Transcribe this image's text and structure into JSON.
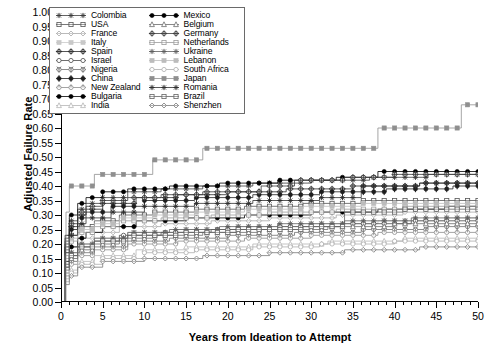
{
  "chart_data": {
    "type": "line",
    "title": "",
    "xlabel": "Years from Ideation to Attempt",
    "ylabel": "Adjusted Failure Rate",
    "xlim": [
      0,
      50
    ],
    "ylim": [
      0.0,
      1.0
    ],
    "xticks": [
      0,
      5,
      10,
      15,
      20,
      25,
      30,
      35,
      40,
      45,
      50
    ],
    "xtick_labels": [
      "0",
      "5",
      "10",
      "15",
      "20",
      "25",
      "30",
      "35",
      "40",
      "45",
      "50"
    ],
    "yticks": [
      0.0,
      0.05,
      0.1,
      0.15,
      0.2,
      0.25,
      0.3,
      0.35,
      0.4,
      0.45,
      0.5,
      0.55,
      0.6,
      0.65,
      0.7,
      0.75,
      0.8,
      0.85,
      0.9,
      0.95,
      1.0
    ],
    "ytick_labels": [
      "0.00",
      "0.05",
      "0.10",
      "0.15",
      "0.20",
      "0.25",
      "0.30",
      "0.35",
      "0.40",
      "0.45",
      "0.50",
      "0.55",
      "0.60",
      "0.65",
      "0.70",
      "0.75",
      "0.80",
      "0.85",
      "0.90",
      "0.95",
      "1.00"
    ],
    "grid": false,
    "legend_position": "upper-left",
    "step_style": "post",
    "series": [
      {
        "name": "Colombia",
        "marker": "star",
        "color": "#3d3d3d",
        "x": [
          0,
          0.5,
          1,
          2,
          3,
          5,
          8,
          12,
          17,
          23,
          30,
          37,
          44,
          50
        ],
        "y": [
          0.0,
          0.22,
          0.28,
          0.32,
          0.34,
          0.36,
          0.38,
          0.39,
          0.4,
          0.41,
          0.42,
          0.43,
          0.44,
          0.44
        ]
      },
      {
        "name": "USA",
        "marker": "square-open",
        "color": "#555555",
        "x": [
          0,
          0.5,
          1,
          2,
          4,
          7,
          11,
          16,
          22,
          29,
          36,
          43,
          50
        ],
        "y": [
          0.0,
          0.18,
          0.23,
          0.26,
          0.28,
          0.3,
          0.31,
          0.32,
          0.33,
          0.34,
          0.35,
          0.35,
          0.35
        ]
      },
      {
        "name": "France",
        "marker": "diamond-open",
        "color": "#a8a8a8",
        "x": [
          0,
          0.5,
          1,
          2,
          4,
          7,
          12,
          18,
          25,
          33,
          41,
          50
        ],
        "y": [
          0.0,
          0.15,
          0.19,
          0.22,
          0.24,
          0.26,
          0.27,
          0.28,
          0.29,
          0.3,
          0.31,
          0.31
        ]
      },
      {
        "name": "Italy",
        "marker": "square-filled",
        "color": "#c9c9c9",
        "x": [
          0,
          0.5,
          1,
          2,
          4,
          8,
          14,
          21,
          29,
          38,
          46,
          50
        ],
        "y": [
          0.0,
          0.13,
          0.17,
          0.2,
          0.22,
          0.24,
          0.25,
          0.26,
          0.27,
          0.28,
          0.29,
          0.29
        ]
      },
      {
        "name": "Spain",
        "marker": "circle-cross",
        "color": "#2b2b2b",
        "x": [
          0,
          0.5,
          1,
          2,
          3,
          5,
          9,
          14,
          20,
          27,
          35,
          43,
          50
        ],
        "y": [
          0.0,
          0.2,
          0.26,
          0.3,
          0.32,
          0.34,
          0.36,
          0.37,
          0.38,
          0.39,
          0.4,
          0.41,
          0.41
        ]
      },
      {
        "name": "Israel",
        "marker": "circle-open",
        "color": "#4a4a4a",
        "x": [
          0,
          0.5,
          1,
          2,
          4,
          7,
          12,
          18,
          26,
          34,
          42,
          50
        ],
        "y": [
          0.0,
          0.12,
          0.16,
          0.19,
          0.21,
          0.23,
          0.24,
          0.25,
          0.26,
          0.27,
          0.28,
          0.28
        ]
      },
      {
        "name": "Nigeria",
        "marker": "circle-y",
        "color": "#707070",
        "x": [
          0,
          0.5,
          1,
          2,
          4,
          8,
          13,
          20,
          28,
          36,
          44,
          50
        ],
        "y": [
          0.0,
          0.1,
          0.14,
          0.17,
          0.19,
          0.21,
          0.22,
          0.23,
          0.24,
          0.25,
          0.26,
          0.26
        ]
      },
      {
        "name": "China",
        "marker": "circle-plus",
        "color": "#1f1f1f",
        "x": [
          0,
          0.5,
          1,
          2,
          3,
          6,
          10,
          16,
          23,
          31,
          39,
          47,
          50
        ],
        "y": [
          0.0,
          0.19,
          0.25,
          0.29,
          0.31,
          0.33,
          0.35,
          0.36,
          0.37,
          0.38,
          0.39,
          0.4,
          0.4
        ]
      },
      {
        "name": "New Zealand",
        "marker": "circle-dash",
        "color": "#8d8d8d",
        "x": [
          0,
          0.5,
          1,
          2,
          4,
          8,
          14,
          22,
          30,
          38,
          46,
          50
        ],
        "y": [
          0.0,
          0.09,
          0.13,
          0.16,
          0.18,
          0.2,
          0.21,
          0.22,
          0.23,
          0.24,
          0.24,
          0.24
        ]
      },
      {
        "name": "Bulgaria",
        "marker": "circle-filled",
        "color": "#000000",
        "x": [
          0,
          0.5,
          1,
          2,
          3,
          5,
          9,
          15,
          22,
          30,
          38,
          46,
          50
        ],
        "y": [
          0.0,
          0.14,
          0.19,
          0.22,
          0.24,
          0.26,
          0.28,
          0.29,
          0.3,
          0.31,
          0.32,
          0.33,
          0.33
        ]
      },
      {
        "name": "India",
        "marker": "triangle-open",
        "color": "#b5b5b5",
        "x": [
          0,
          0.5,
          1,
          2,
          4,
          9,
          15,
          23,
          32,
          41,
          50
        ],
        "y": [
          0.0,
          0.08,
          0.11,
          0.14,
          0.16,
          0.18,
          0.19,
          0.2,
          0.21,
          0.22,
          0.22
        ]
      },
      {
        "name": "Mexico",
        "marker": "circle-filled",
        "color": "#000000",
        "x": [
          0,
          0.5,
          1,
          2,
          3,
          5,
          8,
          13,
          19,
          26,
          33,
          38,
          44,
          50
        ],
        "y": [
          0.0,
          0.23,
          0.3,
          0.34,
          0.36,
          0.38,
          0.39,
          0.4,
          0.41,
          0.42,
          0.43,
          0.45,
          0.45,
          0.45
        ]
      },
      {
        "name": "Belgium",
        "marker": "triangle-open",
        "color": "#6b6b6b",
        "x": [
          0,
          0.5,
          1,
          2,
          4,
          7,
          11,
          17,
          24,
          32,
          40,
          48,
          50
        ],
        "y": [
          0.0,
          0.11,
          0.15,
          0.18,
          0.2,
          0.22,
          0.23,
          0.24,
          0.25,
          0.26,
          0.27,
          0.27,
          0.27
        ]
      },
      {
        "name": "Germany",
        "marker": "circle-cross",
        "color": "#3a3a3a",
        "x": [
          0,
          0.5,
          1,
          2,
          3,
          5,
          8,
          12,
          17,
          24,
          28,
          34,
          40,
          45,
          50
        ],
        "y": [
          0.0,
          0.21,
          0.27,
          0.31,
          0.33,
          0.35,
          0.36,
          0.37,
          0.38,
          0.4,
          0.42,
          0.43,
          0.44,
          0.44,
          0.44
        ]
      },
      {
        "name": "Netherlands",
        "marker": "square-open",
        "color": "#9a9a9a",
        "x": [
          0,
          0.5,
          1,
          2,
          4,
          7,
          12,
          18,
          25,
          33,
          41,
          50
        ],
        "y": [
          0.0,
          0.16,
          0.21,
          0.24,
          0.26,
          0.28,
          0.29,
          0.3,
          0.31,
          0.32,
          0.33,
          0.33
        ]
      },
      {
        "name": "Ukraine",
        "marker": "star",
        "color": "#5e5e5e",
        "x": [
          0,
          0.5,
          1,
          2,
          4,
          8,
          13,
          19,
          26,
          34,
          42,
          50
        ],
        "y": [
          0.0,
          0.13,
          0.17,
          0.2,
          0.22,
          0.24,
          0.25,
          0.26,
          0.27,
          0.28,
          0.29,
          0.29
        ]
      },
      {
        "name": "Lebanon",
        "marker": "square-filled",
        "color": "#bcbcbc",
        "x": [
          0,
          0.5,
          1,
          2,
          4,
          7,
          11,
          16,
          22,
          29,
          36,
          43,
          50
        ],
        "y": [
          0.0,
          0.17,
          0.22,
          0.25,
          0.27,
          0.29,
          0.3,
          0.31,
          0.32,
          0.33,
          0.34,
          0.34,
          0.34
        ]
      },
      {
        "name": "South Africa",
        "marker": "circle-open",
        "color": "#adadad",
        "x": [
          0,
          0.5,
          1,
          2,
          5,
          10,
          16,
          23,
          31,
          40,
          50
        ],
        "y": [
          0.0,
          0.07,
          0.1,
          0.13,
          0.15,
          0.17,
          0.18,
          0.19,
          0.2,
          0.21,
          0.21
        ]
      },
      {
        "name": "Japan",
        "marker": "square-filled",
        "color": "#8f8f8f",
        "x": [
          0,
          0.6,
          1,
          4,
          8,
          11,
          14,
          17,
          21,
          36,
          38,
          45,
          48,
          50
        ],
        "y": [
          0.0,
          0.31,
          0.4,
          0.44,
          0.44,
          0.49,
          0.49,
          0.53,
          0.53,
          0.53,
          0.6,
          0.6,
          0.68,
          0.68
        ]
      },
      {
        "name": "Romania",
        "marker": "star",
        "color": "#2f2f2f",
        "x": [
          0,
          0.5,
          1,
          2,
          3,
          6,
          10,
          16,
          23,
          31,
          36,
          43,
          50
        ],
        "y": [
          0.0,
          0.17,
          0.23,
          0.27,
          0.29,
          0.31,
          0.33,
          0.34,
          0.35,
          0.36,
          0.4,
          0.41,
          0.41
        ]
      },
      {
        "name": "Brazil",
        "marker": "square-open",
        "color": "#646464",
        "x": [
          0,
          0.5,
          1,
          2,
          4,
          8,
          14,
          21,
          29,
          34,
          41,
          50
        ],
        "y": [
          0.0,
          0.12,
          0.16,
          0.19,
          0.21,
          0.23,
          0.24,
          0.25,
          0.26,
          0.31,
          0.32,
          0.32
        ]
      },
      {
        "name": "Shenzhen",
        "marker": "diamond-open",
        "color": "#7a7a7a",
        "x": [
          0,
          0.5,
          1,
          2,
          5,
          10,
          17,
          25,
          34,
          43,
          50
        ],
        "y": [
          0.0,
          0.06,
          0.09,
          0.12,
          0.14,
          0.15,
          0.16,
          0.17,
          0.18,
          0.19,
          0.19
        ]
      }
    ]
  },
  "legend": {
    "columns": [
      [
        "Colombia",
        "USA",
        "France",
        "Italy",
        "Spain",
        "Israel",
        "Nigeria",
        "China",
        "New Zealand",
        "Bulgaria",
        "India"
      ],
      [
        "Mexico",
        "Belgium",
        "Germany",
        "Netherlands",
        "Ukraine",
        "Lebanon",
        "South Africa",
        "Japan",
        "Romania",
        "Brazil",
        "Shenzhen"
      ]
    ]
  }
}
